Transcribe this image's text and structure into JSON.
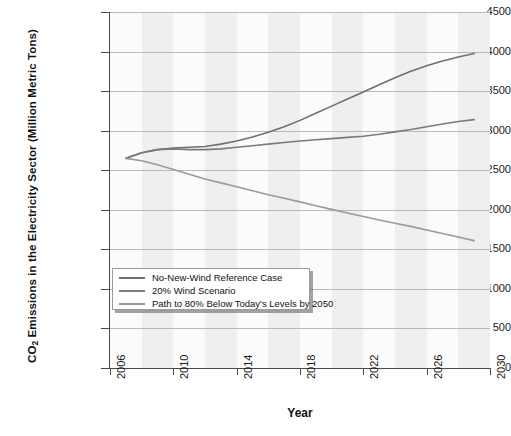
{
  "chart_data": {
    "type": "line",
    "title": "",
    "xlabel": "Year",
    "ylabel": "CO2 Emissions in the Electricity Sector (Million Metric Tons)",
    "ylabel_prefix": "CO",
    "ylabel_sub": "2",
    "ylabel_rest": " Emissions in the Electricity Sector (Million Metric Tons)",
    "xlim": [
      2006,
      2030
    ],
    "ylim": [
      0,
      4500
    ],
    "yticks": [
      0,
      500,
      1000,
      1500,
      2000,
      2500,
      3000,
      3500,
      4000,
      4500
    ],
    "xticks": [
      2006,
      2010,
      2014,
      2018,
      2022,
      2026,
      2030
    ],
    "grid": "horizontal gridlines, alternating vertical shaded bands",
    "legend_position": "lower-left inside plot",
    "x": [
      2007,
      2008,
      2009,
      2010,
      2011,
      2012,
      2013,
      2014,
      2015,
      2016,
      2017,
      2018,
      2019,
      2020,
      2021,
      2022,
      2023,
      2024,
      2025,
      2026,
      2027,
      2028,
      2029
    ],
    "series": [
      {
        "name": "No-New-Wind Reference Case",
        "color": "#6f6f6f",
        "values": [
          2650,
          2720,
          2760,
          2780,
          2790,
          2800,
          2830,
          2870,
          2920,
          2980,
          3050,
          3130,
          3220,
          3310,
          3400,
          3490,
          3580,
          3670,
          3750,
          3820,
          3880,
          3930,
          3975
        ]
      },
      {
        "name": "20% Wind Scenario",
        "color": "#7a7a7a",
        "values": [
          2650,
          2720,
          2760,
          2770,
          2760,
          2760,
          2770,
          2790,
          2810,
          2830,
          2850,
          2870,
          2885,
          2900,
          2915,
          2930,
          2955,
          2985,
          3015,
          3050,
          3085,
          3115,
          3140
        ]
      },
      {
        "name": "Path to 80% Below Today's Levels by 2050",
        "color": "#9a9a9a",
        "values": [
          2650,
          2620,
          2570,
          2510,
          2450,
          2390,
          2340,
          2290,
          2240,
          2190,
          2145,
          2100,
          2050,
          2005,
          1960,
          1915,
          1870,
          1830,
          1790,
          1745,
          1700,
          1655,
          1610
        ]
      }
    ]
  },
  "legend": {
    "entries": [
      {
        "label": "No-New-Wind Reference Case",
        "color": "#6f6f6f"
      },
      {
        "label": "20% Wind Scenario",
        "color": "#7a7a7a"
      },
      {
        "label": "Path to 80% Below Today's Levels by 2050",
        "color": "#9a9a9a"
      }
    ]
  },
  "colors": {
    "background": "#ffffff",
    "plot_background": "#fbfbfb",
    "band": "#ebebeb",
    "gridline": "#b9b9b9",
    "axis": "#4a4a4a"
  }
}
